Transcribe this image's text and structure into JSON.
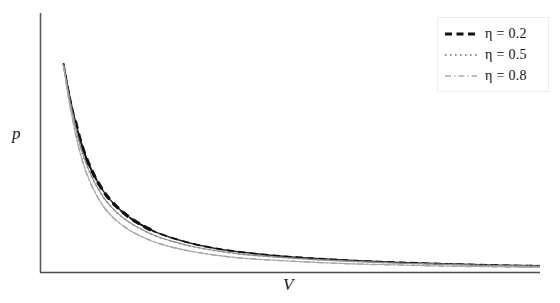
{
  "figure": {
    "background_color": "#ffffff",
    "width": 560,
    "height": 303
  },
  "axes": {
    "x_label": "V",
    "y_label": "p",
    "x_axis_color": "#4d4d4d",
    "y_axis_color": "#5a5a5a",
    "ticks_shown": false,
    "tick_labels": []
  },
  "legend": {
    "position": "top-right",
    "border_color": "#ededed",
    "background_color": "#ffffff",
    "entries": [
      {
        "label": "η = 0.2",
        "eta_symbol": "η",
        "equals": " = ",
        "value": "0.2",
        "style": "dashed",
        "color": "#111111",
        "width": 3.2
      },
      {
        "label": "η = 0.5",
        "eta_symbol": "η",
        "equals": " = ",
        "value": "0.5",
        "style": "dotted",
        "color": "#8e8e8e",
        "width": 1.6
      },
      {
        "label": "η = 0.8",
        "eta_symbol": "η",
        "equals": " = ",
        "value": "0.8",
        "style": "dashdot",
        "color": "#a8a8a8",
        "width": 1.4
      }
    ]
  },
  "chart_data": {
    "type": "line",
    "title": "",
    "xlabel": "V",
    "ylabel": "p",
    "xlim": [
      0,
      1
    ],
    "ylim": [
      0,
      1
    ],
    "grid": false,
    "legend_position": "upper right",
    "x": [
      0.045,
      0.06,
      0.08,
      0.1,
      0.125,
      0.15,
      0.175,
      0.2,
      0.23,
      0.26,
      0.3,
      0.35,
      0.4,
      0.46,
      0.52,
      0.58,
      0.65,
      0.72,
      0.8,
      0.88,
      0.95,
      1.0
    ],
    "series": [
      {
        "name": "η = 0.2",
        "eta": 0.2,
        "style": "dashed",
        "color": "#111111",
        "values": [
          0.805,
          0.655,
          0.5,
          0.398,
          0.312,
          0.255,
          0.214,
          0.183,
          0.154,
          0.133,
          0.111,
          0.091,
          0.077,
          0.065,
          0.056,
          0.049,
          0.042,
          0.037,
          0.032,
          0.028,
          0.025,
          0.024
        ]
      },
      {
        "name": "η = 0.5",
        "eta": 0.5,
        "style": "dotted",
        "color": "#8e8e8e",
        "values": [
          0.8,
          0.64,
          0.478,
          0.374,
          0.288,
          0.233,
          0.194,
          0.166,
          0.139,
          0.12,
          0.1,
          0.082,
          0.069,
          0.059,
          0.051,
          0.045,
          0.039,
          0.034,
          0.03,
          0.026,
          0.024,
          0.022
        ]
      },
      {
        "name": "η = 0.8",
        "eta": 0.8,
        "style": "dashdot",
        "color": "#a8a8a8",
        "values": [
          0.795,
          0.62,
          0.448,
          0.34,
          0.253,
          0.2,
          0.164,
          0.138,
          0.114,
          0.097,
          0.08,
          0.065,
          0.054,
          0.046,
          0.04,
          0.035,
          0.03,
          0.027,
          0.023,
          0.021,
          0.019,
          0.018
        ]
      }
    ],
    "emphasis_segment": {
      "series": "η = 0.2",
      "note": "Thick black dashed overlay drawn over the upper-middle portion of the first curve."
    }
  }
}
